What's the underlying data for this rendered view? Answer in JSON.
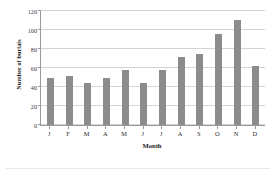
{
  "chart_data": {
    "type": "bar",
    "title": "",
    "subtitle": "",
    "xlabel": "Month",
    "ylabel": "Number of burials",
    "categories": [
      "J",
      "F",
      "M",
      "A",
      "M",
      "J",
      "J",
      "A",
      "S",
      "O",
      "N",
      "D"
    ],
    "values": [
      50,
      52,
      44,
      49,
      58,
      44,
      58,
      72,
      75,
      96,
      111,
      62
    ],
    "series": [
      {
        "name": "Number of burials",
        "values": [
          50,
          52,
          44,
          49,
          58,
          44,
          58,
          72,
          75,
          96,
          111,
          62
        ]
      }
    ],
    "ylim": [
      0,
      120
    ],
    "yticks": [
      0,
      20,
      40,
      60,
      80,
      100,
      120
    ],
    "ytick_labels": [
      "0",
      "20",
      "40",
      "60",
      "80",
      "100",
      "120"
    ],
    "grid": true,
    "grid_axis": "y",
    "legend": false,
    "legend_position": "none",
    "bar_color": "#8c8c8c",
    "gridline_color": "#d4d4d4",
    "axis_color": "#9a9a9a"
  }
}
